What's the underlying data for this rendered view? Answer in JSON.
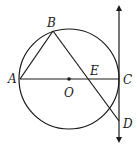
{
  "diagram": {
    "type": "geometry",
    "colors": {
      "stroke": "#1a1a1a",
      "background": "#ffffff"
    },
    "circle": {
      "center": "O",
      "cx": 69,
      "cy": 79,
      "r": 50
    },
    "points": {
      "A": {
        "label": "A",
        "x": 20,
        "y": 79
      },
      "B": {
        "label": "B",
        "x": 53,
        "y": 31
      },
      "C": {
        "label": "C",
        "x": 119,
        "y": 79
      },
      "D": {
        "label": "D",
        "x": 119,
        "y": 121
      },
      "E": {
        "label": "E",
        "x": 89,
        "y": 79
      },
      "O": {
        "label": "O",
        "x": 69,
        "y": 79
      }
    },
    "segments": [
      "AB",
      "BD",
      "AC"
    ],
    "tangent_line": {
      "through": [
        "C",
        "D"
      ],
      "arrows": "both"
    }
  }
}
